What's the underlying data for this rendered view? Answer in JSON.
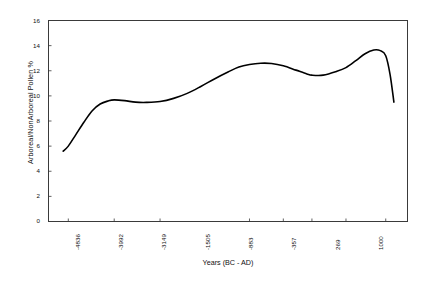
{
  "chart_data": {
    "type": "line",
    "title": "",
    "xlabel": "Years (BC - AD)",
    "ylabel": "Arboreal/NonArboreal Pollen %",
    "xlim": [
      -5200,
      1400
    ],
    "ylim": [
      0,
      16
    ],
    "grid": false,
    "legend": false,
    "line_color": "#000000",
    "line_width": 1.6,
    "frame_color": "#3a3a3a",
    "background": "#ffffff",
    "xtick_labels": [
      "-4836",
      "-3992",
      "-3149",
      "-1505",
      "-883",
      "-357",
      "269",
      "1000"
    ],
    "xtick_values": [
      -4836,
      -3992,
      -3149,
      -1505,
      -883,
      -357,
      269,
      1000
    ],
    "ytick_labels": [
      "0",
      "2",
      "4",
      "6",
      "8",
      "10",
      "12",
      "14",
      "16"
    ],
    "ytick_values": [
      0,
      2,
      4,
      6,
      8,
      10,
      12,
      14,
      16
    ],
    "series": [
      {
        "name": "Arboreal/NonArboreal Pollen %",
        "x": [
          -4930,
          -4836,
          -4700,
          -4550,
          -4400,
          -4250,
          -4100,
          -3992,
          -3800,
          -3600,
          -3400,
          -3149,
          -2900,
          -2650,
          -2400,
          -2150,
          -1900,
          -1700,
          -1505,
          -1300,
          -1100,
          -883,
          -650,
          -450,
          -357,
          -150,
          100,
          269,
          450,
          620,
          780,
          900,
          1000,
          1080,
          1150
        ],
        "y": [
          5.6,
          6.0,
          6.9,
          7.9,
          8.8,
          9.35,
          9.6,
          9.68,
          9.62,
          9.5,
          9.48,
          9.55,
          9.8,
          10.2,
          10.75,
          11.35,
          11.9,
          12.3,
          12.5,
          12.6,
          12.58,
          12.4,
          12.05,
          11.75,
          11.65,
          11.65,
          11.95,
          12.25,
          12.8,
          13.35,
          13.65,
          13.6,
          13.2,
          11.7,
          9.5
        ]
      }
    ]
  }
}
